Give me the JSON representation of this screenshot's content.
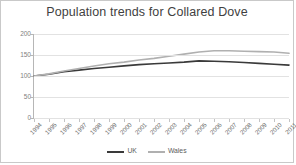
{
  "chart_data": {
    "type": "line",
    "title": "Population trends for Collared Dove",
    "xlabel": "",
    "ylabel": "",
    "ylim": [
      0,
      200
    ],
    "yticks": [
      0,
      50,
      100,
      150,
      200
    ],
    "grid": true,
    "legend_position": "bottom",
    "categories": [
      "1994",
      "1995",
      "1996",
      "1997",
      "1998",
      "1999",
      "2000",
      "2001",
      "2002",
      "2003",
      "2004",
      "2005",
      "2006",
      "2007",
      "2008",
      "2009",
      "2010",
      "2011"
    ],
    "series": [
      {
        "name": "UK",
        "color": "#3a3a3a",
        "values": [
          100,
          104,
          110,
          114,
          118,
          121,
          124,
          127,
          129,
          131,
          133,
          136,
          135,
          134,
          132,
          130,
          128,
          126
        ]
      },
      {
        "name": "Wales",
        "color": "#b0b0b0",
        "values": [
          100,
          105,
          112,
          118,
          124,
          129,
          133,
          138,
          142,
          147,
          152,
          157,
          160,
          160,
          159,
          158,
          157,
          154
        ]
      }
    ]
  },
  "legend": {
    "items": [
      {
        "label": "UK",
        "color": "#3a3a3a"
      },
      {
        "label": "Wales",
        "color": "#b0b0b0"
      }
    ]
  },
  "axes": {
    "y_tick_labels": [
      "200",
      "150",
      "100",
      "50",
      "0"
    ],
    "x_tick_labels": [
      "1994",
      "1995",
      "1996",
      "1997",
      "1998",
      "1999",
      "2000",
      "2001",
      "2002",
      "2003",
      "2004",
      "2005",
      "2006",
      "2007",
      "2008",
      "2009",
      "2010",
      "2011"
    ]
  }
}
